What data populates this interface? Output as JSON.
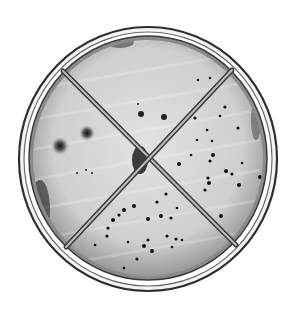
{
  "image": {
    "subject": "petri dish quadrant plate",
    "description": "Grayscale photograph of a round petri dish divided into four quadrants by an X-shaped divider, with dark bacterial colonies of varying density in each quadrant",
    "quadrants": [
      {
        "position": "left",
        "colonies": "few large diffuse colonies"
      },
      {
        "position": "top",
        "colonies": "few small colonies"
      },
      {
        "position": "right",
        "colonies": "many scattered colonies"
      },
      {
        "position": "bottom",
        "colonies": "many scattered colonies"
      }
    ],
    "colors": {
      "background": "#ffffff",
      "agar": "#d8d8d8",
      "rim": "#3a3a3a",
      "colony": "#111111"
    }
  }
}
